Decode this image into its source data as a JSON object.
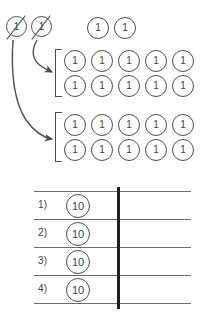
{
  "worksheet": {
    "title": "Regrouping ones into tens",
    "stroke_color": "#4e4e4e",
    "divider_color": "#1d1d1d",
    "line_color": "#6d6d6d",
    "background_color": "#ffffff"
  },
  "crossed_out": {
    "label": "crossed-out ones",
    "tokens": [
      {
        "value": "1",
        "struck": true,
        "x": 6,
        "y": 16
      },
      {
        "value": "1",
        "struck": true,
        "x": 31,
        "y": 16
      }
    ]
  },
  "loose_ones": {
    "label": "remaining ones",
    "tokens": [
      {
        "value": "1",
        "x": 87,
        "y": 17
      },
      {
        "value": "1",
        "x": 114,
        "y": 17
      }
    ]
  },
  "groups": [
    {
      "name": "group-one",
      "bracket": {
        "x": 55,
        "y": 49,
        "height": 48
      },
      "rows": [
        {
          "values": [
            "1",
            "1",
            "1",
            "1",
            "1"
          ],
          "y": 50
        },
        {
          "values": [
            "1",
            "1",
            "1",
            "1",
            "1"
          ],
          "y": 75
        }
      ],
      "start_x": 64,
      "step_x": 27
    },
    {
      "name": "group-two",
      "bracket": {
        "x": 55,
        "y": 112,
        "height": 50
      },
      "rows": [
        {
          "values": [
            "1",
            "1",
            "1",
            "1",
            "1"
          ],
          "y": 114
        },
        {
          "values": [
            "1",
            "1",
            "1",
            "1",
            "1"
          ],
          "y": 139
        }
      ],
      "start_x": 64,
      "step_x": 27
    }
  ],
  "arrows": [
    {
      "name": "arrow-to-group-one",
      "from": "crossed-one-2",
      "to": "group-one"
    },
    {
      "name": "arrow-to-group-two",
      "from": "crossed-one-1",
      "to": "group-two"
    }
  ],
  "table": {
    "left": 34,
    "right": 191,
    "divider_x": 117,
    "top": 191,
    "row_height": 28,
    "rows": [
      {
        "number": "1)",
        "token": "10",
        "answer": ""
      },
      {
        "number": "2)",
        "token": "10",
        "answer": ""
      },
      {
        "number": "3)",
        "token": "10",
        "answer": ""
      },
      {
        "number": "4)",
        "token": "10",
        "answer": ""
      }
    ]
  }
}
